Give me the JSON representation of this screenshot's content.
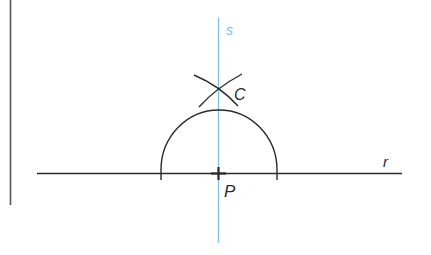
{
  "diagram": {
    "colors": {
      "line": "#2b2b2b",
      "perpendicular": "#7cc4e0",
      "margin_bar": "#555555",
      "background": "#ffffff"
    },
    "labels": {
      "perpendicular_line": "s",
      "base_line": "r",
      "point_on_line": "P",
      "intersection_point": "C"
    },
    "elements": {
      "margin_bar": {
        "x": 10,
        "y1": 0,
        "y2": 205
      },
      "line_r": {
        "x1": 37,
        "x2": 402,
        "y": 173
      },
      "line_s": {
        "x": 218,
        "y1": 18,
        "y2": 243
      },
      "point_P": {
        "x": 218,
        "y": 173
      },
      "semicircle": {
        "cx": 218,
        "cy": 173,
        "r": 58
      },
      "point_C": {
        "x": 218,
        "y": 87
      }
    }
  }
}
